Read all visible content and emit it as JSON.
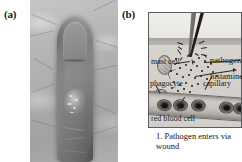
{
  "figure": {
    "panels": [
      {
        "key": "a",
        "label": "(a)",
        "type": "photograph",
        "subject": "inflamed swollen fingertip"
      },
      {
        "key": "b",
        "label": "(b)",
        "type": "diagram",
        "caption_number": "1.",
        "caption_text": "Pathogen enters via wound",
        "caption_full": "1. Pathogen enters via wound",
        "labels": {
          "mast_cell": "mast cell",
          "pathogen": "pathogen",
          "histamine": "histamine",
          "phagocyte": "phagocyte",
          "capillary": "capillary",
          "red_blood_cell": "red blood cell"
        },
        "elements": {
          "thorn": "thorn-splinter",
          "skin_surface": "epidermis",
          "tissue": "dermis",
          "vessel": "capillary"
        }
      }
    ],
    "colors": {
      "page_background": "#ffffff",
      "diagram_border": "#5c5c5c",
      "tissue_fill": "#d4d1cc",
      "epidermis_fill": "#b0ada9",
      "ink": "#17150f",
      "rbc_fill": "#2a2826"
    },
    "histamine_dot_count": 34,
    "red_blood_cell_count": 5
  }
}
